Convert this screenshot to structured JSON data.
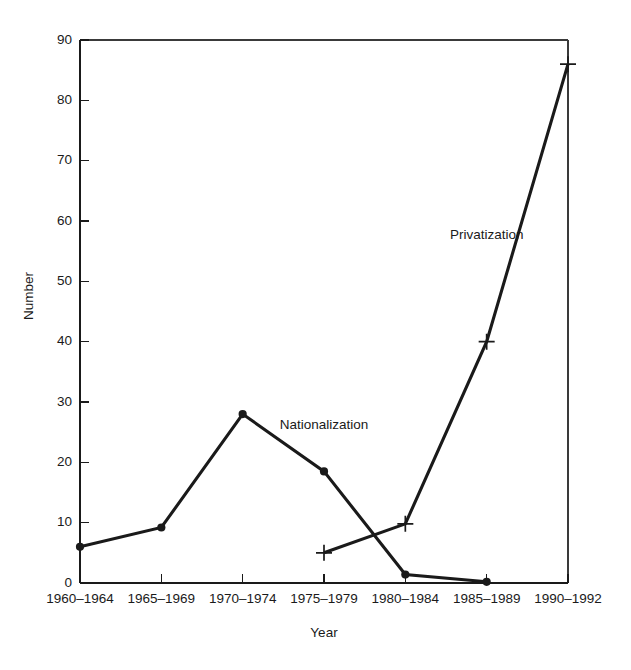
{
  "chart_data": {
    "type": "line",
    "title": "",
    "xlabel": "Year",
    "ylabel": "Number",
    "categories": [
      "1960–1964",
      "1965–1969",
      "1970–1974",
      "1975–1979",
      "1980–1984",
      "1985–1989",
      "1990–1992"
    ],
    "ylim": [
      0,
      90
    ],
    "yticks": [
      0,
      10,
      20,
      30,
      40,
      50,
      60,
      70,
      80,
      90
    ],
    "ytick_labels": [
      "0",
      "10",
      "20",
      "30",
      "40",
      "50",
      "60",
      "70",
      "80",
      "90"
    ],
    "grid": false,
    "legend_position": "inline-annotation",
    "series": [
      {
        "name": "Nationalization",
        "marker": "filled-circle",
        "color": "#1a1a1a",
        "x": [
          "1960–1964",
          "1965–1969",
          "1970–1974",
          "1975–1979",
          "1980–1984",
          "1985–1989"
        ],
        "values": [
          6,
          9.2,
          28,
          18.5,
          1.4,
          0.2
        ],
        "annotation": {
          "text": "Nationalization",
          "x_category": "1975–1979",
          "y_value": 25.5
        }
      },
      {
        "name": "Privatization",
        "marker": "plus-cross",
        "color": "#1a1a1a",
        "x": [
          "1975–1979",
          "1980–1984",
          "1985–1989",
          "1990–1992"
        ],
        "values": [
          5,
          9.8,
          40,
          86
        ],
        "annotation": {
          "text": "Privatization",
          "x_category": "1985–1989",
          "y_value": 57
        }
      }
    ],
    "annotations": [
      {
        "text": "Nationalization",
        "value": 25.5
      },
      {
        "text": "Privatization",
        "value": 57
      }
    ],
    "colors": {
      "line": "#1a1a1a",
      "axis": "#1a1a1a",
      "frame": "#3a3a3a",
      "background": "#ffffff"
    }
  }
}
